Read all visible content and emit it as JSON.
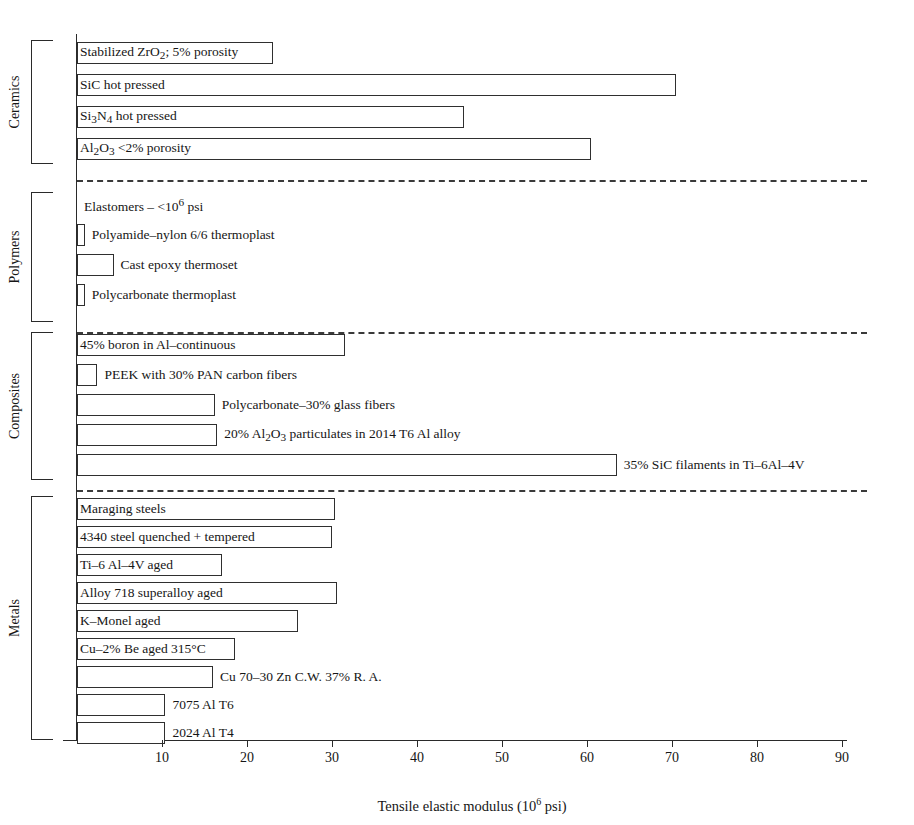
{
  "chart_data": {
    "type": "bar",
    "orientation": "horizontal",
    "title": "",
    "xlabel": "Tensile elastic modulus (10^6 psi)",
    "ylabel": "",
    "xlim": [
      0,
      94
    ],
    "xticks": [
      10,
      20,
      30,
      40,
      50,
      60,
      70,
      80,
      90
    ],
    "xtick_labels": [
      "10",
      "20",
      "30",
      "40",
      "50",
      "60",
      "70",
      "80",
      "90"
    ],
    "grid": false,
    "legend": "none",
    "units": "10^6 psi",
    "groups": [
      {
        "name": "Ceramics",
        "bars": [
          {
            "label": "Stabilized ZrO2; 5% porosity",
            "label_html": "Stabilized ZrO<sub>2</sub>; 5% porosity",
            "value": 23,
            "label_inside": true
          },
          {
            "label": "SiC hot pressed",
            "label_html": "SiC hot pressed",
            "value": 70.5,
            "label_inside": true
          },
          {
            "label": "Si3N4 hot pressed",
            "label_html": "Si<sub>3</sub>N<sub>4</sub> hot pressed",
            "value": 45.5,
            "label_inside": true
          },
          {
            "label": "Al2O3 <2% porosity",
            "label_html": "Al<sub>2</sub>O<sub>3</sub> &lt;2% porosity",
            "value": 60.5,
            "label_inside": true
          }
        ]
      },
      {
        "name": "Polymers",
        "bars": [
          {
            "label": "Elastomers - <10^6 psi",
            "label_html": "Elastomers &ndash; &lt;10<sup>6</sup> psi",
            "value": 0,
            "label_inside": false
          },
          {
            "label": "Polyamide-nylon 6/6 thermoplast",
            "label_html": "Polyamide&ndash;nylon 6/6 thermoplast",
            "value": 0.9,
            "label_inside": false
          },
          {
            "label": "Cast epoxy thermoset",
            "label_html": "Cast epoxy thermoset",
            "value": 4.3,
            "label_inside": false
          },
          {
            "label": "Polycarbonate thermoplast",
            "label_html": "Polycarbonate thermoplast",
            "value": 0.9,
            "label_inside": false
          }
        ]
      },
      {
        "name": "Composites",
        "bars": [
          {
            "label": "45% boron in Al-continuous",
            "label_html": "45% boron in Al&ndash;continuous",
            "value": 31.5,
            "label_inside": true
          },
          {
            "label": "PEEK with 30% PAN carbon fibers",
            "label_html": "PEEK with 30% PAN carbon fibers",
            "value": 2.4,
            "label_inside": false
          },
          {
            "label": "Polycarbonate-30% glass fibers",
            "label_html": "Polycarbonate&ndash;30% glass fibers",
            "value": 16.2,
            "label_inside": false
          },
          {
            "label": "20% Al2O3 particulates in 2014 T6 Al alloy",
            "label_html": "20% Al<sub>2</sub>O<sub>3</sub> particulates in 2014 T6 Al alloy",
            "value": 16.5,
            "label_inside": false
          },
          {
            "label": "35% SiC filaments in Ti-6Al-4V",
            "label_html": "35% SiC filaments in Ti&ndash;6Al&ndash;4V",
            "value": 63.5,
            "label_inside": false
          }
        ]
      },
      {
        "name": "Metals",
        "bars": [
          {
            "label": "Maraging steels",
            "label_html": "Maraging steels",
            "value": 30.3,
            "label_inside": true
          },
          {
            "label": "4340 steel quenched  + tempered",
            "label_html": "4340 steel quenched  + tempered",
            "value": 30.0,
            "label_inside": true
          },
          {
            "label": "Ti-6 Al-4V aged",
            "label_html": "Ti&ndash;6 Al&ndash;4V aged",
            "value": 17.0,
            "label_inside": true
          },
          {
            "label": "Alloy 718 superalloy aged",
            "label_html": "Alloy 718 superalloy aged",
            "value": 30.6,
            "label_inside": true
          },
          {
            "label": "K-Monel aged",
            "label_html": "K&ndash;Monel aged",
            "value": 26.0,
            "label_inside": true
          },
          {
            "label": "Cu-2% Be aged 315C",
            "label_html": "Cu&ndash;2% Be aged 315&deg;C",
            "value": 18.6,
            "label_inside": true
          },
          {
            "label": "Cu 70-30 Zn C.W. 37% R. A.",
            "label_html": "Cu 70&ndash;30 Zn C.W. 37% R. A.",
            "value": 16.0,
            "label_inside": false
          },
          {
            "label": "7075 Al T6",
            "label_html": "7075 Al T6",
            "value": 10.4,
            "label_inside": false
          },
          {
            "label": "2024 Al T4",
            "label_html": "2024 Al T4",
            "value": 10.4,
            "label_inside": false
          }
        ]
      }
    ]
  }
}
